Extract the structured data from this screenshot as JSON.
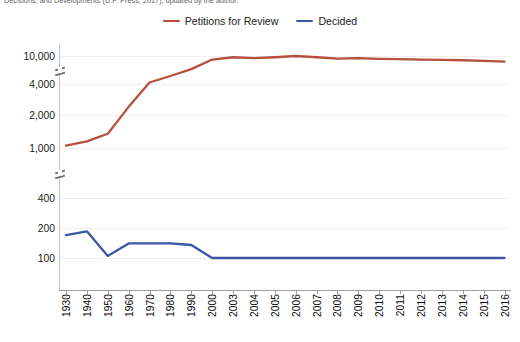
{
  "caption": "Decisions, and Developments (U.P. Press, 2017), updated by the author.",
  "legend": {
    "position": "top-center",
    "items": [
      {
        "label": "Petitions for Review",
        "color": "#b5503c",
        "icon": "line-swatch"
      },
      {
        "label": "Decided",
        "color": "#3c55a5",
        "icon": "line-swatch"
      }
    ]
  },
  "chart_data": {
    "type": "line",
    "title": "",
    "subtitle": "",
    "xlabel": "",
    "ylabel": "",
    "grid": true,
    "legend_position": "top-center",
    "y_scale": "broken-log",
    "y_axis_breaks": [
      "between 10,000 and 4,000",
      "between 1,000 and 400"
    ],
    "ytick_labels": [
      "10,000",
      "4,000",
      "2,000",
      "1,000",
      "400",
      "200",
      "100"
    ],
    "ytick_values": [
      10000,
      4000,
      2000,
      1000,
      400,
      200,
      100
    ],
    "categories": [
      "1930",
      "1940",
      "1950",
      "1960",
      "1970",
      "1980",
      "1990",
      "2000",
      "2003",
      "2004",
      "2005",
      "2006",
      "2007",
      "2008",
      "2009",
      "2010",
      "2011",
      "2012",
      "2013",
      "2014",
      "2015",
      "2016"
    ],
    "x": [
      "1930",
      "1940",
      "1950",
      "1960",
      "1970",
      "1980",
      "1990",
      "2000",
      "2003",
      "2004",
      "2005",
      "2006",
      "2007",
      "2008",
      "2009",
      "2010",
      "2011",
      "2012",
      "2013",
      "2014",
      "2015",
      "2016"
    ],
    "series": [
      {
        "name": "Petitions for Review",
        "color": "#b5503c",
        "values": [
          1050,
          1150,
          1350,
          2400,
          4200,
          5200,
          6500,
          8900,
          9600,
          9300,
          9600,
          10200,
          9600,
          9200,
          9300,
          9100,
          9000,
          8900,
          8800,
          8700,
          8500,
          8300
        ]
      },
      {
        "name": "Decided",
        "color": "#3c55a5",
        "values": [
          170,
          185,
          105,
          140,
          140,
          140,
          135,
          55,
          50,
          50,
          48,
          45,
          50,
          52,
          52,
          55,
          45,
          53,
          48,
          45,
          43,
          38
        ]
      }
    ]
  }
}
